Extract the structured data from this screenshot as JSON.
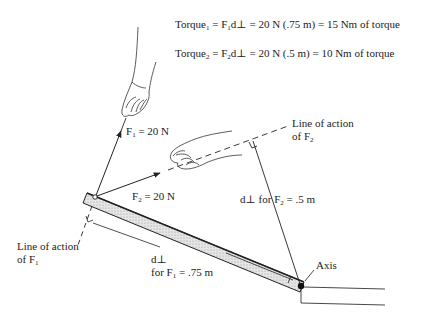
{
  "equations": {
    "torque1": {
      "prefix": "Torque",
      "sub": "1",
      "rest": " = F",
      "sub2": "1",
      "rest2": "d⊥ = 20 N (.75 m) = 15 Nm of torque"
    },
    "torque2": {
      "prefix": "Torque",
      "sub": "2",
      "rest": " = F",
      "sub2": "2",
      "rest2": "d⊥ = 20 N (.5 m) = 10 Nm of torque"
    }
  },
  "labels": {
    "f1": {
      "main": "F",
      "sub": "1",
      "rest": " = 20 N"
    },
    "f2": {
      "main": "F",
      "sub": "2",
      "rest": " = 20 N"
    },
    "line_action_f2": {
      "line1": "Line of action",
      "line2a": "of F",
      "line2sub": "2"
    },
    "line_action_f1": {
      "line1": "Line of action",
      "line2a": "of F",
      "line2sub": "1"
    },
    "dperp_f2": {
      "a": "d⊥ for F",
      "sub": "2",
      "b": " = .5 m"
    },
    "dperp_f1": {
      "line1": "d⊥",
      "a": "for F",
      "sub": "1",
      "b": " = .75 m"
    },
    "axis": "Axis"
  },
  "colors": {
    "ink": "#222222",
    "bar_fill": "#d8d8d8",
    "background": "#ffffff"
  }
}
